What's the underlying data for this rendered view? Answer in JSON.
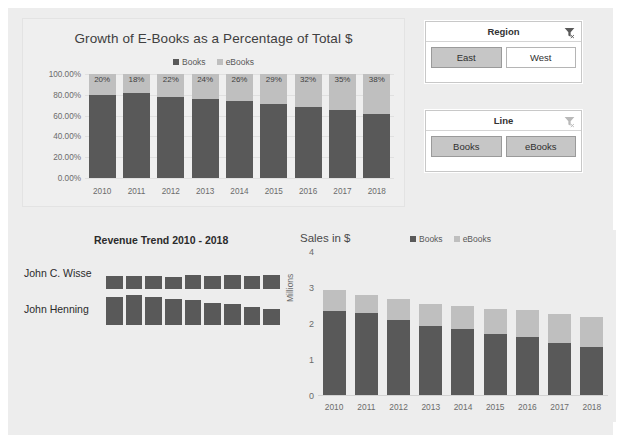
{
  "theme": {
    "page_bg": "#ffffff",
    "canvas_bg": "#ededed",
    "books_color": "#595959",
    "ebooks_color": "#bfbfbf",
    "slicer_selected_bg": "#c6c6c6",
    "text_color": "#404040"
  },
  "pct_chart": {
    "title": "Growth of E-Books as a Percentage of Total $",
    "legend": [
      "Books",
      "eBooks"
    ],
    "y_ticks": [
      "100.00%",
      "80.00%",
      "60.00%",
      "40.00%",
      "20.00%",
      "0.00%"
    ]
  },
  "slicers": [
    {
      "name": "Region",
      "title": "Region",
      "clear_icon": "clear-filter-icon",
      "items": [
        {
          "label": "East",
          "selected": true
        },
        {
          "label": "West",
          "selected": false
        }
      ]
    },
    {
      "name": "Line",
      "title": "Line",
      "clear_icon": "clear-filter-icon",
      "items": [
        {
          "label": "Books",
          "selected": true
        },
        {
          "label": "eBooks",
          "selected": true
        }
      ]
    }
  ],
  "trend_chart": {
    "title": "Revenue Trend 2010 - 2018",
    "rows": [
      {
        "name": "John C. Wisse"
      },
      {
        "name": "John Henning"
      }
    ]
  },
  "sales_chart": {
    "title": "Sales in $",
    "axis_title": "Millions",
    "legend": [
      "Books",
      "eBooks"
    ],
    "y_ticks": [
      "4",
      "3",
      "2",
      "1",
      "0"
    ]
  },
  "chart_data": [
    {
      "id": "pct_chart",
      "type": "bar",
      "stacked": true,
      "normalized": true,
      "title": "Growth of E-Books as a Percentage of Total $",
      "xlabel": "",
      "ylabel": "",
      "ylim": [
        0,
        1
      ],
      "ytick_labels": [
        "0.00%",
        "20.00%",
        "40.00%",
        "60.00%",
        "80.00%",
        "100.00%"
      ],
      "grid": true,
      "legend": [
        "Books",
        "eBooks"
      ],
      "legend_position": "top",
      "categories": [
        "2010",
        "2011",
        "2012",
        "2013",
        "2014",
        "2015",
        "2016",
        "2017",
        "2018"
      ],
      "series": [
        {
          "name": "Books",
          "values": [
            80,
            82,
            78,
            76,
            74,
            71,
            68,
            65,
            62
          ]
        },
        {
          "name": "eBooks",
          "values": [
            20,
            18,
            22,
            24,
            26,
            29,
            32,
            35,
            38
          ]
        }
      ],
      "data_labels": [
        "20%",
        "18%",
        "22%",
        "24%",
        "26%",
        "29%",
        "32%",
        "35%",
        "38%"
      ]
    },
    {
      "id": "trend_chart",
      "type": "bar",
      "title": "Revenue Trend 2010 - 2018",
      "xlabel": "",
      "ylabel": "",
      "grid": false,
      "legend": [],
      "categories": [
        "2010",
        "2011",
        "2012",
        "2013",
        "2014",
        "2015",
        "2016",
        "2017",
        "2018"
      ],
      "series": [
        {
          "name": "John C. Wisse",
          "values": [
            12,
            12,
            12,
            11,
            13,
            12,
            13,
            12,
            13
          ]
        },
        {
          "name": "John Henning",
          "values": [
            26,
            28,
            26,
            24,
            23,
            21,
            20,
            17,
            15
          ]
        }
      ]
    },
    {
      "id": "sales_chart",
      "type": "bar",
      "stacked": true,
      "title": "Sales in $",
      "xlabel": "",
      "ylabel": "Millions",
      "ylim": [
        0,
        4
      ],
      "ytick_labels": [
        "0",
        "1",
        "2",
        "3",
        "4"
      ],
      "grid": false,
      "legend": [
        "Books",
        "eBooks"
      ],
      "legend_position": "top",
      "categories": [
        "2010",
        "2011",
        "2012",
        "2013",
        "2014",
        "2015",
        "2016",
        "2017",
        "2018"
      ],
      "series": [
        {
          "name": "Books",
          "values": [
            2.35,
            2.3,
            2.1,
            1.95,
            1.85,
            1.72,
            1.63,
            1.48,
            1.36
          ]
        },
        {
          "name": "eBooks",
          "values": [
            0.59,
            0.5,
            0.59,
            0.62,
            0.65,
            0.7,
            0.77,
            0.8,
            0.83
          ]
        }
      ]
    }
  ]
}
